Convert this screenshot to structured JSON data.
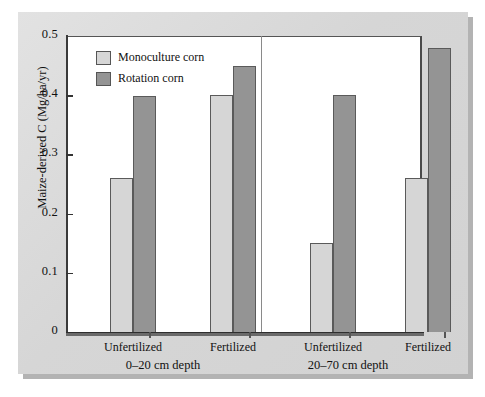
{
  "chart_data": {
    "type": "bar",
    "title": "",
    "xlabel": "",
    "ylabel": "Maize-derived C (Mg/ha/yr)",
    "ylim": [
      0,
      0.5
    ],
    "yticks": [
      "0",
      "0.1",
      "0.2",
      "0.3",
      "0.4",
      "0.5"
    ],
    "ytick_values": [
      0,
      0.1,
      0.2,
      0.3,
      0.4,
      0.5
    ],
    "grid": false,
    "legend_position": "top-left",
    "categories": [
      "Unfertilized",
      "Fertilized",
      "Unfertilized",
      "Fertilized"
    ],
    "group_labels": [
      "0–20 cm depth",
      "20–70 cm depth"
    ],
    "series": [
      {
        "name": "Monoculture corn",
        "color": "#d6d6d6",
        "values": [
          0.26,
          0.4,
          0.15,
          0.26
        ]
      },
      {
        "name": "Rotation corn",
        "color": "#949494",
        "values": [
          0.398,
          0.45,
          0.4,
          0.48
        ]
      }
    ],
    "panels": [
      {
        "label": "0–20 cm depth",
        "categories": [
          "Unfertilized",
          "Fertilized"
        ],
        "monoculture_corn": [
          0.26,
          0.4
        ],
        "rotation_corn": [
          0.398,
          0.45
        ]
      },
      {
        "label": "20–70 cm depth",
        "categories": [
          "Unfertilized",
          "Fertilized"
        ],
        "monoculture_corn": [
          0.15,
          0.26
        ],
        "rotation_corn": [
          0.4,
          0.48
        ]
      }
    ]
  },
  "legend": {
    "items": [
      {
        "label": "Monoculture corn",
        "color": "#d6d6d6"
      },
      {
        "label": "Rotation corn",
        "color": "#949494"
      }
    ]
  },
  "axis": {
    "y_title": "Maize-derived C (Mg/ha/yr)",
    "y_tick_labels": [
      "0.5",
      "0.4",
      "0.3",
      "0.2",
      "0.1",
      "0"
    ]
  },
  "x_labels": {
    "cat_0": "Unfertilized",
    "cat_1": "Fertilized",
    "cat_2": "Unfertilized",
    "cat_3": "Fertilized",
    "group_0": "0–20 cm depth",
    "group_1": "20–70 cm depth"
  },
  "colors": {
    "monoculture": "#d6d6d6",
    "rotation": "#949494",
    "panel_background": "#d9d9d9",
    "plot_background": "#ffffff",
    "axis": "#333333"
  }
}
